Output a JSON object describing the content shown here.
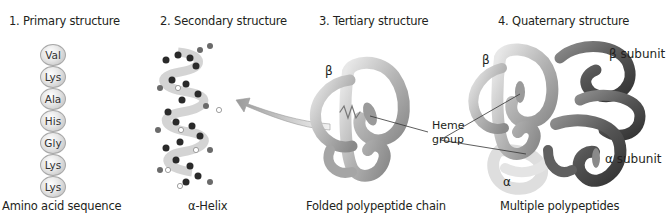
{
  "panels": [
    {
      "title": "1. Primary structure",
      "caption": "Amino acid sequence",
      "residues": [
        "Val",
        "Lys",
        "Ala",
        "His",
        "Gly",
        "Lys",
        "Lys"
      ]
    },
    {
      "title": "2. Secondary structure",
      "caption": "α-Helix"
    },
    {
      "title": "3. Tertiary structure",
      "caption": "Folded polypeptide chain",
      "labels": {
        "beta": "β"
      }
    },
    {
      "title": "4. Quaternary structure",
      "caption": "Multiple polypeptides",
      "labels": {
        "beta": "β",
        "beta_subunit": "β subunit",
        "alpha": "α",
        "alpha_subunit": "α subunit"
      }
    }
  ],
  "callout": {
    "heme_line1": "Heme",
    "heme_line2": "group"
  },
  "colors": {
    "light_chain": "#b8b8b8",
    "dark_chain": "#5a5a5a",
    "pale_chain": "#dcdcdc",
    "arrow": "#a9a9a9"
  }
}
